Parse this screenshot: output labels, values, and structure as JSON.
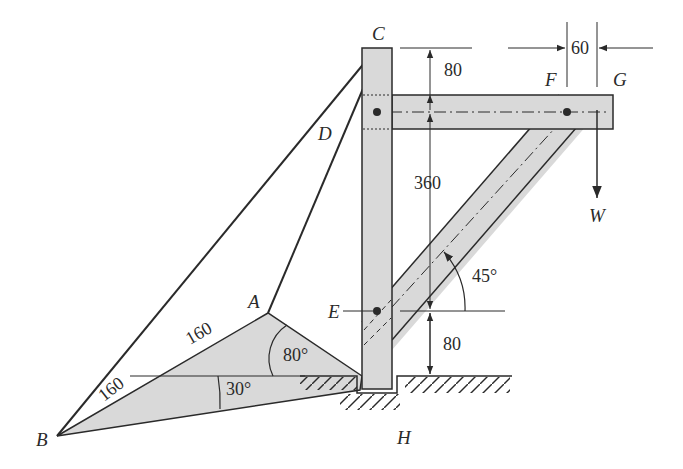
{
  "figure": {
    "type": "mechanical-structure-diagram",
    "fill_color": "#d9d9d9",
    "line_color": "#2a2a2a"
  },
  "points": {
    "A": "A",
    "B": "B",
    "C": "C",
    "D": "D",
    "E": "E",
    "F": "F",
    "G": "G",
    "H": "H"
  },
  "load": {
    "label": "W"
  },
  "dimensions": {
    "top_gap": "80",
    "middle_span": "360",
    "bottom_gap": "80",
    "fg_offset": "60",
    "ab_length": "160",
    "b_lower_length": "160"
  },
  "angles": {
    "brace": "45°",
    "plate_a": "80°",
    "plate_b": "30°"
  }
}
